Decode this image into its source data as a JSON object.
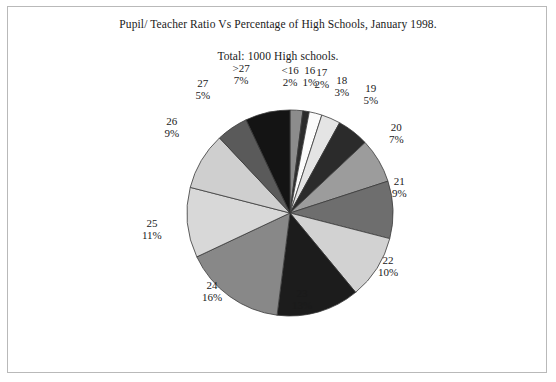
{
  "document": {
    "title": "Pupil/ Teacher Ratio Vs Percentage of High Schools, January 1998.",
    "subtitle": "Total: 1000 High schools."
  },
  "chart_data": {
    "type": "pie",
    "title": "Pupil/ Teacher Ratio Vs Percentage of High Schools, January 1998.",
    "subtitle": "Total: 1000 High schools.",
    "xlabel": "",
    "ylabel": "",
    "legend": "none",
    "grid": false,
    "total_label": "Total: 1000 High schools.",
    "total_value": 1000,
    "units": "percent",
    "start_angle_deg": 0,
    "direction": "clockwise",
    "categories": [
      "<16",
      "16",
      "17",
      "18",
      "19",
      "20",
      "21",
      "22",
      "23",
      "24",
      "25",
      "26",
      "27",
      ">27"
    ],
    "values": [
      2,
      1,
      2,
      3,
      5,
      7,
      9,
      10,
      13,
      16,
      11,
      9,
      5,
      7
    ],
    "labels": [
      {
        "category": "<16",
        "percent": 2,
        "percent_label": "2%",
        "color": "#8c8c8c"
      },
      {
        "category": "16",
        "percent": 1,
        "percent_label": "1%",
        "color": "#2b2b2b"
      },
      {
        "category": "17",
        "percent": 2,
        "percent_label": "2%",
        "color": "#fbfbfb"
      },
      {
        "category": "18",
        "percent": 3,
        "percent_label": "3%",
        "color": "#e4e4e4"
      },
      {
        "category": "19",
        "percent": 5,
        "percent_label": "5%",
        "color": "#2b2b2b"
      },
      {
        "category": "20",
        "percent": 7,
        "percent_label": "7%",
        "color": "#9c9c9c"
      },
      {
        "category": "21",
        "percent": 9,
        "percent_label": "9%",
        "color": "#6e6e6e"
      },
      {
        "category": "22",
        "percent": 10,
        "percent_label": "10%",
        "color": "#d2d2d2"
      },
      {
        "category": "23",
        "percent": 13,
        "percent_label": "13%",
        "color": "#1c1c1c"
      },
      {
        "category": "24",
        "percent": 16,
        "percent_label": "16%",
        "color": "#888888"
      },
      {
        "category": "25",
        "percent": 11,
        "percent_label": "11%",
        "color": "#d8d8d8"
      },
      {
        "category": "26",
        "percent": 9,
        "percent_label": "9%",
        "color": "#cfcfcf"
      },
      {
        "category": "27",
        "percent": 5,
        "percent_label": "5%",
        "color": "#5a5a5a"
      },
      {
        "category": ">27",
        "percent": 7,
        "percent_label": "7%",
        "color": "#141414"
      }
    ]
  },
  "style": {
    "border_color": "#b9b9b9",
    "background": "#ffffff",
    "text_color": "#1a1a1a",
    "slice_outline": "#3a3a3a"
  }
}
